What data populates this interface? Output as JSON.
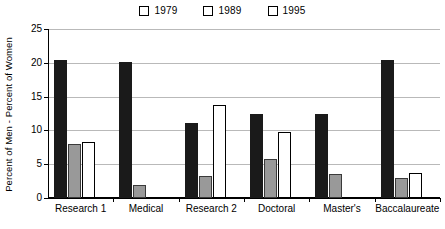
{
  "chart_data": {
    "type": "bar",
    "title": "",
    "xlabel": "",
    "ylabel": "Percent of Men - Percent of Women",
    "ylim": [
      0,
      25
    ],
    "yticks": [
      0,
      5,
      10,
      15,
      20,
      25
    ],
    "grid": true,
    "legend_position": "top-center",
    "categories": [
      "Research 1",
      "Medical",
      "Research 2",
      "Doctoral",
      "Master's",
      "Baccalaureate"
    ],
    "series": [
      {
        "name": "1979",
        "color": "#1a1a1a",
        "values": [
          20.4,
          20.1,
          11.1,
          12.4,
          12.5,
          20.4
        ]
      },
      {
        "name": "1989",
        "color": "#999999",
        "values": [
          8.0,
          1.9,
          3.2,
          5.7,
          3.6,
          2.9
        ]
      },
      {
        "name": "1995",
        "color": "#ffffff",
        "values": [
          8.3,
          0,
          13.7,
          9.7,
          0,
          3.7
        ]
      }
    ]
  }
}
